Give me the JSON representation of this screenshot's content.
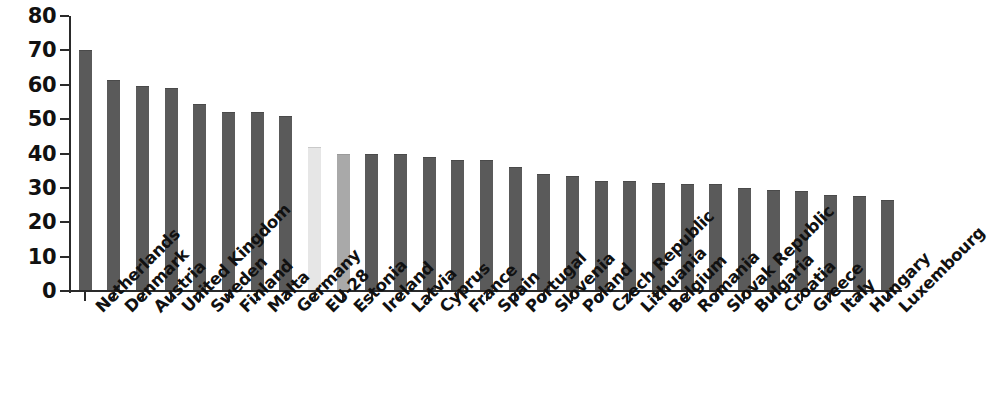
{
  "chart_data": {
    "type": "bar",
    "title": "",
    "subtitle": "",
    "xlabel": "",
    "ylabel": "",
    "ylim": [
      0,
      80
    ],
    "y_ticks": [
      0,
      10,
      20,
      30,
      40,
      50,
      60,
      70,
      80
    ],
    "grid": false,
    "legend_position": "none",
    "orientation": "vertical",
    "sorted": "descending",
    "categories": [
      "Netherlands",
      "Denmark",
      "Austria",
      "United Kingdom",
      "Sweden",
      "Finland",
      "Malta",
      "Germany",
      "EU-28",
      "Estonia",
      "Ireland",
      "Latvia",
      "Cyprus",
      "France",
      "Spain",
      "Portugal",
      "Slovenia",
      "Poland",
      "Czech Republic",
      "Lithuania",
      "Belgium",
      "Romania",
      "Slovak Republic",
      "Bulgaria",
      "Croatia",
      "Greece",
      "Italy",
      "Hungary",
      "Luxembourg"
    ],
    "values": [
      70.0,
      61.5,
      59.5,
      59.0,
      54.5,
      52.0,
      52.0,
      51.0,
      42.0,
      40.0,
      40.0,
      40.0,
      39.0,
      38.0,
      38.0,
      36.0,
      34.0,
      33.5,
      32.0,
      32.0,
      31.5,
      31.2,
      31.2,
      30.0,
      29.3,
      29.0,
      28.0,
      27.5,
      26.5
    ],
    "bar_styles": [
      "dark",
      "dark",
      "dark",
      "dark",
      "dark",
      "dark",
      "dark",
      "dark",
      "light",
      "mid",
      "dark",
      "dark",
      "dark",
      "dark",
      "dark",
      "dark",
      "dark",
      "dark",
      "dark",
      "dark",
      "dark",
      "dark",
      "dark",
      "dark",
      "dark",
      "dark",
      "dark",
      "dark",
      "dark"
    ]
  },
  "colors": {
    "bar_dark": "#5a5a5a",
    "bar_light": "#e6e6e6",
    "bar_mid": "#a9a9a9",
    "axis": "#2a2a2a",
    "text": "#111111",
    "background": "#ffffff"
  }
}
